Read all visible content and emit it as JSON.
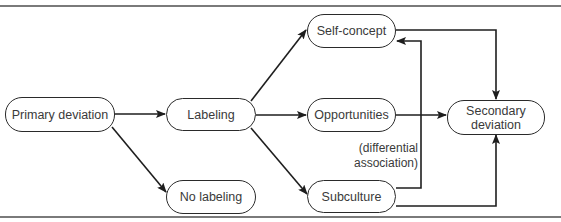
{
  "diagram": {
    "type": "flowchart",
    "nodes": {
      "primary_deviation": {
        "label": "Primary deviation"
      },
      "labeling": {
        "label": "Labeling"
      },
      "no_labeling": {
        "label": "No labeling"
      },
      "self_concept": {
        "label": "Self-concept"
      },
      "opportunities": {
        "label": "Opportunities"
      },
      "subculture": {
        "label": "Subculture"
      },
      "secondary_deviation": {
        "label": "Secondary\ndeviation"
      }
    },
    "annotation": "(differential\nassociation)",
    "edges": [
      {
        "from": "Primary deviation",
        "to": "Labeling"
      },
      {
        "from": "Primary deviation",
        "to": "No labeling"
      },
      {
        "from": "Labeling",
        "to": "Self-concept"
      },
      {
        "from": "Labeling",
        "to": "Opportunities"
      },
      {
        "from": "Labeling",
        "to": "Subculture"
      },
      {
        "from": "Self-concept",
        "to": "Secondary deviation"
      },
      {
        "from": "Opportunities",
        "to": "Secondary deviation"
      },
      {
        "from": "Subculture",
        "to": "Secondary deviation"
      },
      {
        "from": "Subculture",
        "to": "Self-concept",
        "label": "(differential association)"
      }
    ],
    "colors": {
      "line": "#1e1e1e",
      "text": "#3a3a3a",
      "rule": "#7a7a7a"
    }
  }
}
